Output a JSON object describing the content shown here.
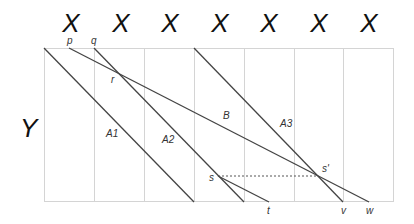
{
  "diagram": {
    "column_labels": [
      "X",
      "X",
      "X",
      "X",
      "X",
      "X",
      "X"
    ],
    "row_label": "Y",
    "point_labels": {
      "p": "p",
      "q": "q",
      "r": "r",
      "s": "s",
      "s_prime": "s'",
      "t": "t",
      "v": "v",
      "w": "w"
    },
    "line_labels": {
      "A1": "A1",
      "A2": "A2",
      "A3": "A3",
      "B": "B"
    },
    "colors": {
      "line": "#444444",
      "grid": "#cccccc",
      "text": "#111111"
    }
  }
}
